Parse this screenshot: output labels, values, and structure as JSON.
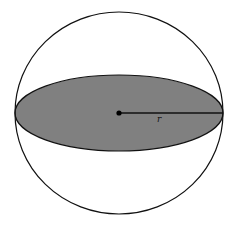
{
  "diagram": {
    "colors": {
      "background": "#ffffff",
      "stroke": "#111111",
      "cross_section_fill": "#808080"
    },
    "sphere": {
      "cx": 119,
      "cy": 113,
      "rx": 104,
      "ry": 101
    },
    "cross_section": {
      "cx": 119,
      "cy": 113,
      "rx": 104,
      "ry": 38
    },
    "center_point": {
      "cx": 119,
      "cy": 113,
      "r": 2.6
    },
    "radius_line": {
      "x1": 119,
      "y1": 113,
      "x2": 223,
      "y2": 113
    },
    "radius_label": {
      "text": "r",
      "x": 157,
      "y": 122
    }
  }
}
